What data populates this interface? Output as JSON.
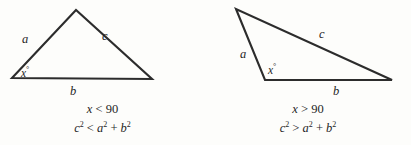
{
  "figures": [
    {
      "id": "acute-triangle",
      "type": "acute",
      "vertices": {
        "left": [
          12,
          78
        ],
        "apex": [
          76,
          10
        ],
        "right": [
          152,
          79
        ]
      },
      "labels": {
        "side_a": "a",
        "side_b": "b",
        "side_c": "c",
        "angle": "x",
        "degree_symbol": "°"
      },
      "caption": {
        "angle_condition": {
          "variable": "x",
          "operator": "<",
          "value": "90"
        },
        "relation": {
          "left_base": "c",
          "left_exp": "2",
          "operator": "<",
          "right_first_base": "a",
          "right_first_exp": "2",
          "plus": "+",
          "right_second_base": "b",
          "right_second_exp": "2"
        }
      }
    },
    {
      "id": "obtuse-triangle",
      "type": "obtuse",
      "vertices": {
        "top": [
          31,
          9
        ],
        "left": [
          60,
          80
        ],
        "right": [
          187,
          80
        ]
      },
      "labels": {
        "side_a": "a",
        "side_b": "b",
        "side_c": "c",
        "angle": "x",
        "degree_symbol": "°"
      },
      "caption": {
        "angle_condition": {
          "variable": "x",
          "operator": ">",
          "value": "90"
        },
        "relation": {
          "left_base": "c",
          "left_exp": "2",
          "operator": ">",
          "right_first_base": "a",
          "right_first_exp": "2",
          "plus": "+",
          "right_second_base": "b",
          "right_second_exp": "2"
        }
      }
    }
  ],
  "style": {
    "ink": "#2c2c2c",
    "background": "#fdfdfb"
  }
}
